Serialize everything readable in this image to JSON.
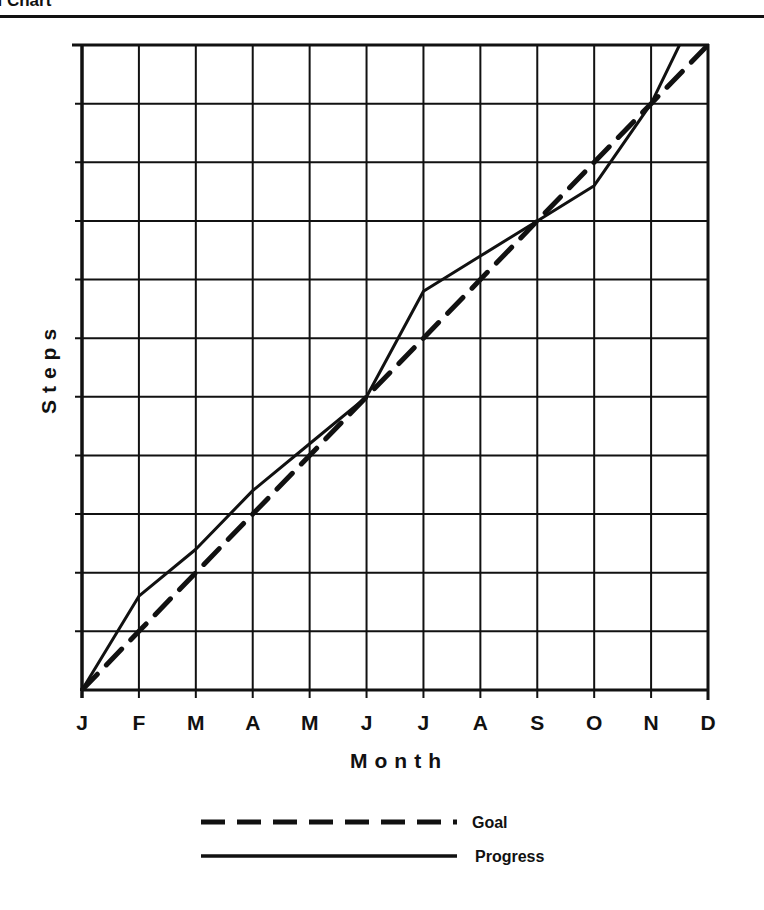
{
  "header": {
    "title_fragment": "al Chart"
  },
  "chart_data": {
    "type": "line",
    "title": "al Chart",
    "xlabel": "Month",
    "ylabel": "Steps",
    "categories": [
      "J",
      "F",
      "M",
      "A",
      "M",
      "J",
      "J",
      "A",
      "S",
      "O",
      "N",
      "D"
    ],
    "ylim": [
      0,
      11
    ],
    "y_gridlines": 11,
    "y_tick_labels": [],
    "grid": true,
    "legend_position": "bottom-center",
    "series": [
      {
        "name": "Goal",
        "style": "dashed",
        "color": "#111111",
        "values": [
          0,
          1,
          2,
          3,
          4,
          5,
          6,
          7,
          8,
          9,
          10,
          11
        ]
      },
      {
        "name": "Progress",
        "style": "solid",
        "color": "#111111",
        "values": [
          0,
          1.6,
          2.4,
          3.4,
          4.2,
          5.0,
          6.8,
          7.4,
          8.0,
          8.6,
          10.0,
          12.0
        ]
      }
    ]
  }
}
